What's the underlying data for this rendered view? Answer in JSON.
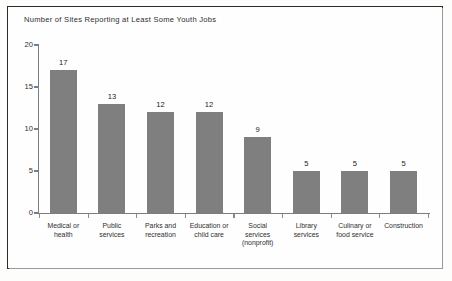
{
  "chart_data": {
    "type": "bar",
    "title": "Number of Sites Reporting at Least Some Youth Jobs",
    "xlabel": "",
    "ylabel": "",
    "ylim": [
      0,
      20
    ],
    "yticks": [
      "0",
      "5",
      "10",
      "15",
      "20"
    ],
    "grid": false,
    "legend": null,
    "bar_color": "#7f7f7f",
    "categories": [
      "Medical or health",
      "Public services",
      "Parks and recreation",
      "Education or child care",
      "Social services (nonprofit)",
      "Library services",
      "Culinary or food service",
      "Construction"
    ],
    "category_lines": [
      [
        "Medical or",
        "health"
      ],
      [
        "Public",
        "services"
      ],
      [
        "Parks and",
        "recreation"
      ],
      [
        "Education or",
        "child care"
      ],
      [
        "Social",
        "services",
        "(nonprofit)"
      ],
      [
        "Library",
        "services"
      ],
      [
        "Culinary or",
        "food service"
      ],
      [
        "Construction"
      ]
    ],
    "values": [
      17,
      13,
      12,
      12,
      9,
      5,
      5,
      5
    ],
    "value_labels": [
      "17",
      "13",
      "12",
      "12",
      "9",
      "5",
      "5",
      "5"
    ]
  }
}
